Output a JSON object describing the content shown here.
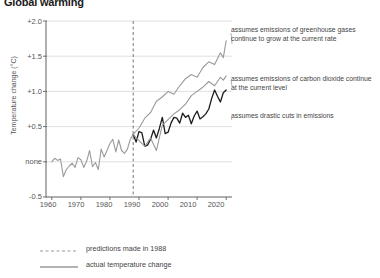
{
  "title": "Global warming",
  "axes": {
    "ylabel": "Temperature change (°C)",
    "yticks": [
      "+2.0",
      "+1.5",
      "+1.0",
      "+0.5",
      "none",
      "-0.5"
    ],
    "xticks": [
      "1960",
      "1970",
      "1980",
      "1990",
      "2000",
      "2010",
      "2020"
    ]
  },
  "annotations": {
    "scenario_a": "assumes emissions of greenhouse gases continue to grow at the current rate",
    "scenario_b": "assumes emissions of  carbon dioxide continue at the current level",
    "scenario_c": "assumes drastic cuts in emissions"
  },
  "legend": {
    "dashed": "predictions made in 1988",
    "solid": "actual temperature change"
  },
  "colors": {
    "gray_line": "#9a9a9a",
    "black_line": "#1c1c1c",
    "grid": "#d8d8d8",
    "axis": "#6e6e6e"
  },
  "chart_data": {
    "type": "line",
    "title": "Global warming",
    "xlabel": "",
    "ylabel": "Temperature change (°C)",
    "xlim": [
      1958,
      2022
    ],
    "ylim": [
      -0.5,
      2.0
    ],
    "grid": true,
    "legend_position": "below-plot",
    "prediction_start_year": 1988,
    "series": [
      {
        "name": "actual temperature change",
        "style": "solid",
        "color": "#9a9a9a",
        "x": [
          1960,
          1961,
          1962,
          1963,
          1964,
          1965,
          1966,
          1967,
          1968,
          1969,
          1970,
          1971,
          1972,
          1973,
          1974,
          1975,
          1976,
          1977,
          1978,
          1979,
          1980,
          1981,
          1982,
          1983,
          1984,
          1985,
          1986,
          1987,
          1988
        ],
        "values": [
          0.0,
          0.05,
          0.02,
          0.04,
          -0.21,
          -0.11,
          -0.06,
          -0.02,
          -0.08,
          0.06,
          0.03,
          -0.08,
          0.01,
          0.16,
          -0.07,
          -0.01,
          -0.11,
          0.18,
          0.07,
          0.16,
          0.26,
          0.32,
          0.14,
          0.31,
          0.16,
          0.12,
          0.18,
          0.32,
          0.39
        ]
      },
      {
        "name": "actual temperature change (observed, post-1988)",
        "style": "solid",
        "color": "#1c1c1c",
        "x": [
          1988,
          1989,
          1990,
          1991,
          1992,
          1993,
          1994,
          1995,
          1996,
          1997,
          1998,
          1999,
          2000,
          2001,
          2002,
          2003,
          2004,
          2005,
          2006,
          2007,
          2008,
          2009,
          2010,
          2011,
          2012,
          2013,
          2014,
          2015,
          2016,
          2017,
          2018,
          2019,
          2020
        ],
        "values": [
          0.39,
          0.28,
          0.43,
          0.41,
          0.22,
          0.24,
          0.32,
          0.45,
          0.34,
          0.47,
          0.63,
          0.4,
          0.42,
          0.55,
          0.63,
          0.62,
          0.55,
          0.69,
          0.63,
          0.66,
          0.54,
          0.65,
          0.72,
          0.61,
          0.64,
          0.68,
          0.75,
          0.9,
          1.02,
          0.93,
          0.85,
          0.98,
          1.02
        ]
      },
      {
        "name": "scenario A: greenhouse gases grow at current rate",
        "style": "solid",
        "color": "#9a9a9a",
        "x": [
          1988,
          1990,
          1992,
          1994,
          1996,
          1998,
          2000,
          2002,
          2004,
          2006,
          2008,
          2010,
          2012,
          2014,
          2016,
          2018,
          2019,
          2020
        ],
        "values": [
          0.39,
          0.48,
          0.62,
          0.7,
          0.86,
          0.92,
          1.0,
          0.96,
          1.08,
          1.18,
          1.24,
          1.2,
          1.34,
          1.42,
          1.38,
          1.55,
          1.48,
          1.72
        ]
      },
      {
        "name": "scenario B: carbon dioxide continues at current level",
        "style": "solid",
        "color": "#9a9a9a",
        "x": [
          1988,
          1990,
          1992,
          1994,
          1996,
          1998,
          2000,
          2002,
          2004,
          2006,
          2008,
          2010,
          2012,
          2014,
          2016,
          2018,
          2019,
          2020
        ],
        "values": [
          0.39,
          0.3,
          0.22,
          0.34,
          0.16,
          0.52,
          0.6,
          0.68,
          0.74,
          0.82,
          0.94,
          1.0,
          1.06,
          1.14,
          1.08,
          1.2,
          1.16,
          1.22
        ]
      }
    ]
  }
}
